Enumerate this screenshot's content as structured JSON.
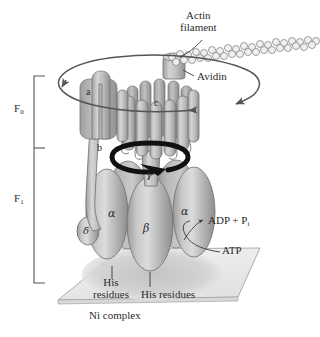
{
  "figure": {
    "background_color": "#ffffff",
    "ink_color": "#2b2b2b",
    "protein_fill": "#b9b9b9",
    "protein_shade_dark": "#8f8f8f",
    "protein_highlight": "#dedede",
    "platform_fill": "#ebebeb",
    "arrow_thin_color": "#555555",
    "arrow_thick_color": "#111111"
  },
  "labels": {
    "actin_filament": {
      "line1": "Actin",
      "line2": "filament"
    },
    "avidin": "Avidin",
    "f0": {
      "base": "F",
      "sub": "0"
    },
    "f1": {
      "base": "F",
      "sub": "1"
    },
    "adp_pi": {
      "base": "ADP + P",
      "sub": "i"
    },
    "atp": "ATP",
    "his_left": {
      "line1": "His",
      "line2": "residues"
    },
    "his_right": "His residues",
    "ni_complex": "Ni complex"
  },
  "subunits": [
    {
      "id": "a",
      "label": "a",
      "style": "roman"
    },
    {
      "id": "b",
      "label": "b",
      "style": "roman"
    },
    {
      "id": "c",
      "label": "c",
      "style": "roman"
    },
    {
      "id": "gamma",
      "label": "γ",
      "style": "greek"
    },
    {
      "id": "alpha_left",
      "label": "α",
      "style": "greek"
    },
    {
      "id": "alpha_right",
      "label": "α",
      "style": "greek"
    },
    {
      "id": "beta",
      "label": "β",
      "style": "greek"
    },
    {
      "id": "delta",
      "label": "δ",
      "style": "greek"
    }
  ],
  "annotations": {
    "rotation_outer": "counterclockwise rotation of actin filament and c-ring",
    "rotation_inner": "rotation of gamma subunit",
    "reaction": "ATP hydrolysis to ADP + Pi drives rotation"
  }
}
